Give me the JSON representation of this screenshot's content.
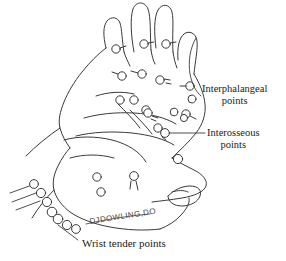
{
  "figure": {
    "background_color": "#ffffff",
    "ink_color": "#3a3a3a",
    "text_color": "#1a1a1a"
  },
  "labels": {
    "interphalangeal": {
      "line1": "Interphalangeal",
      "line2": "points"
    },
    "interosseous": {
      "line1": "Interosseous",
      "line2": "points"
    },
    "wrist": {
      "text": "Wrist tender points"
    }
  },
  "signature": {
    "text": "DJDOWLING,DO"
  },
  "point_groups": [
    {
      "name": "interphalangeal-points",
      "count": 12
    },
    {
      "name": "interosseous-points",
      "count": 6
    },
    {
      "name": "palm-points",
      "count": 3
    },
    {
      "name": "wrist-tender-points",
      "count": 7
    }
  ],
  "leader_lines": [
    {
      "name": "interphalangeal-leader",
      "from": "label",
      "to": "finger-joint-circle"
    },
    {
      "name": "interosseous-leader",
      "from": "label",
      "to": "web-space-circle"
    },
    {
      "name": "wrist-leader",
      "from": "label",
      "to": "ulnar-wrist-chain"
    }
  ]
}
